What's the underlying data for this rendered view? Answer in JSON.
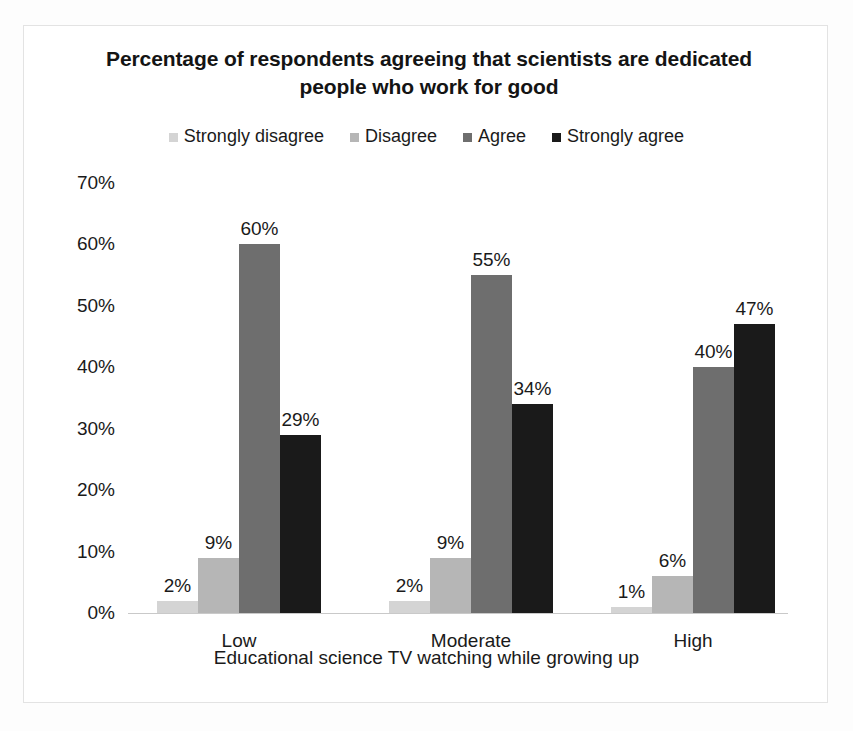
{
  "chart_data": {
    "type": "bar",
    "title": "Percentage of respondents agreeing that scientists are dedicated people who work for good",
    "xlabel": "Educational science TV watching while growing up",
    "ylabel": "",
    "categories": [
      "Low",
      "Moderate",
      "High"
    ],
    "series": [
      {
        "name": "Strongly disagree",
        "color": "#d4d4d4",
        "values": [
          2,
          2,
          1
        ],
        "labels": [
          "2%",
          "2%",
          "1%"
        ]
      },
      {
        "name": "Disagree",
        "color": "#b6b6b6",
        "values": [
          9,
          9,
          6
        ],
        "labels": [
          "9%",
          "9%",
          "6%"
        ]
      },
      {
        "name": "Agree",
        "color": "#6e6e6e",
        "values": [
          60,
          55,
          40
        ],
        "labels": [
          "60%",
          "55%",
          "40%"
        ]
      },
      {
        "name": "Strongly agree",
        "color": "#1a1a1a",
        "values": [
          29,
          34,
          47
        ],
        "labels": [
          "29%",
          "34%",
          "47%"
        ]
      }
    ],
    "ylim": [
      0,
      70
    ],
    "ytick_labels": [
      "70%",
      "60%",
      "50%",
      "40%",
      "30%",
      "20%",
      "10%",
      "0%"
    ],
    "ytick_values": [
      70,
      60,
      50,
      40,
      30,
      20,
      10,
      0
    ],
    "grid": false,
    "legend_position": "top",
    "value_labels": true
  }
}
